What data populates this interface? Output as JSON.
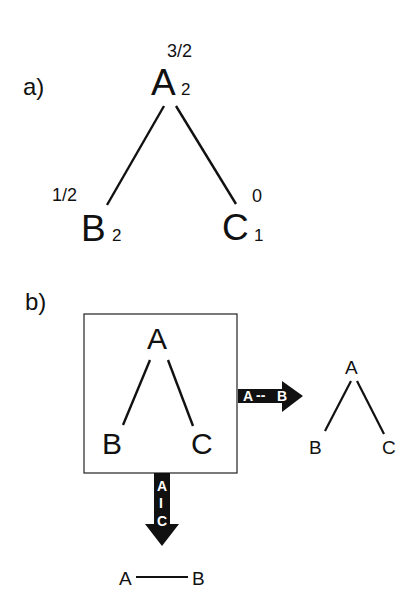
{
  "panel_a": {
    "label": "a)",
    "nodes": [
      {
        "id": "A",
        "label": "A",
        "subscript": "2",
        "weight": "3/2"
      },
      {
        "id": "B",
        "label": "B",
        "subscript": "2",
        "weight": "1/2"
      },
      {
        "id": "C",
        "label": "C",
        "subscript": "1",
        "weight": "0"
      }
    ],
    "edges": [
      [
        "A",
        "B"
      ],
      [
        "A",
        "C"
      ]
    ]
  },
  "panel_b": {
    "label": "b)",
    "box_tree": {
      "nodes": [
        {
          "id": "A",
          "label": "A"
        },
        {
          "id": "B",
          "label": "B"
        },
        {
          "id": "C",
          "label": "C"
        }
      ],
      "edges": [
        [
          "A",
          "B"
        ],
        [
          "A",
          "C"
        ]
      ]
    },
    "arrow_right": {
      "label_left": "A",
      "label_sep": "--",
      "label_right": "B"
    },
    "arrow_down": {
      "label_top": "A",
      "label_sep": "I",
      "label_bottom": "C"
    },
    "right_tree": {
      "nodes": [
        {
          "id": "A",
          "label": "A"
        },
        {
          "id": "B",
          "label": "B"
        },
        {
          "id": "C",
          "label": "C"
        }
      ],
      "edges": [
        [
          "A",
          "B"
        ],
        [
          "A",
          "C"
        ]
      ]
    },
    "bottom_result": {
      "nodes": [
        {
          "id": "A",
          "label": "A"
        },
        {
          "id": "B",
          "label": "B"
        }
      ],
      "edges": [
        [
          "A",
          "B"
        ]
      ]
    }
  }
}
